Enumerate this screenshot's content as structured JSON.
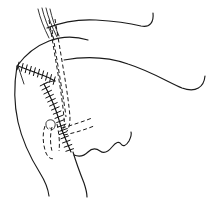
{
  "figure": {
    "domain": "Natural-Image",
    "kind": "line-drawing",
    "description": "Black-and-white line drawing of a lateral view of the head and neck showing a sutured preauricular and cervical incision with dashed flap-undermining lines, the auricle, jawline and neck contour.",
    "canvas": {
      "width": 221,
      "height": 198
    },
    "colors": {
      "background": "#ffffff",
      "ink": "#1a1a1a",
      "ink_soft": "#2a2a2a",
      "suture": "#111111"
    },
    "line_styles": {
      "contour": "solid",
      "planned_incision": "dashed",
      "closed_incision": "hatched-suture"
    },
    "elements": [
      {
        "name": "temporal-hairline-strands",
        "style": "solid",
        "count": 4,
        "role": "hair strands over temple"
      },
      {
        "name": "forehead-brow-contour",
        "style": "solid",
        "role": "upper face / brow outline sweeping right"
      },
      {
        "name": "scalp-cheek-contour",
        "style": "solid",
        "role": "mid face / zygomatic outline sweeping right"
      },
      {
        "name": "preauricular-suture-line",
        "style": "hatched-suture",
        "role": "closed incision anterior to the ear"
      },
      {
        "name": "temporal-suture-line",
        "style": "hatched-suture",
        "role": "closed incision along temporal scalp"
      },
      {
        "name": "cervical-suture-line",
        "style": "hatched-suture",
        "role": "closed incision extending into the neck"
      },
      {
        "name": "flap-undermining-dashed-anterior",
        "style": "dashed",
        "role": "planned / undermined flap margin"
      },
      {
        "name": "flap-undermining-dashed-posterior",
        "style": "dashed",
        "role": "planned / undermined flap margin"
      },
      {
        "name": "ear-auricle-outline",
        "style": "dashed",
        "role": "auricle shown beneath the flap"
      },
      {
        "name": "ear-helix-curl",
        "style": "solid",
        "role": "helix of the ear"
      },
      {
        "name": "mandible-jawline",
        "style": "solid-wavy",
        "role": "jaw / chin contour"
      },
      {
        "name": "neck-anterior-contour",
        "style": "solid",
        "role": "anterior neck outline"
      },
      {
        "name": "neck-posterior-contour",
        "style": "solid",
        "role": "posterior neck outline"
      },
      {
        "name": "lobule-dashed-trace",
        "style": "dashed",
        "role": "earlobe / tragus trace"
      }
    ],
    "labels": [],
    "annotations": [],
    "text_present": false
  }
}
